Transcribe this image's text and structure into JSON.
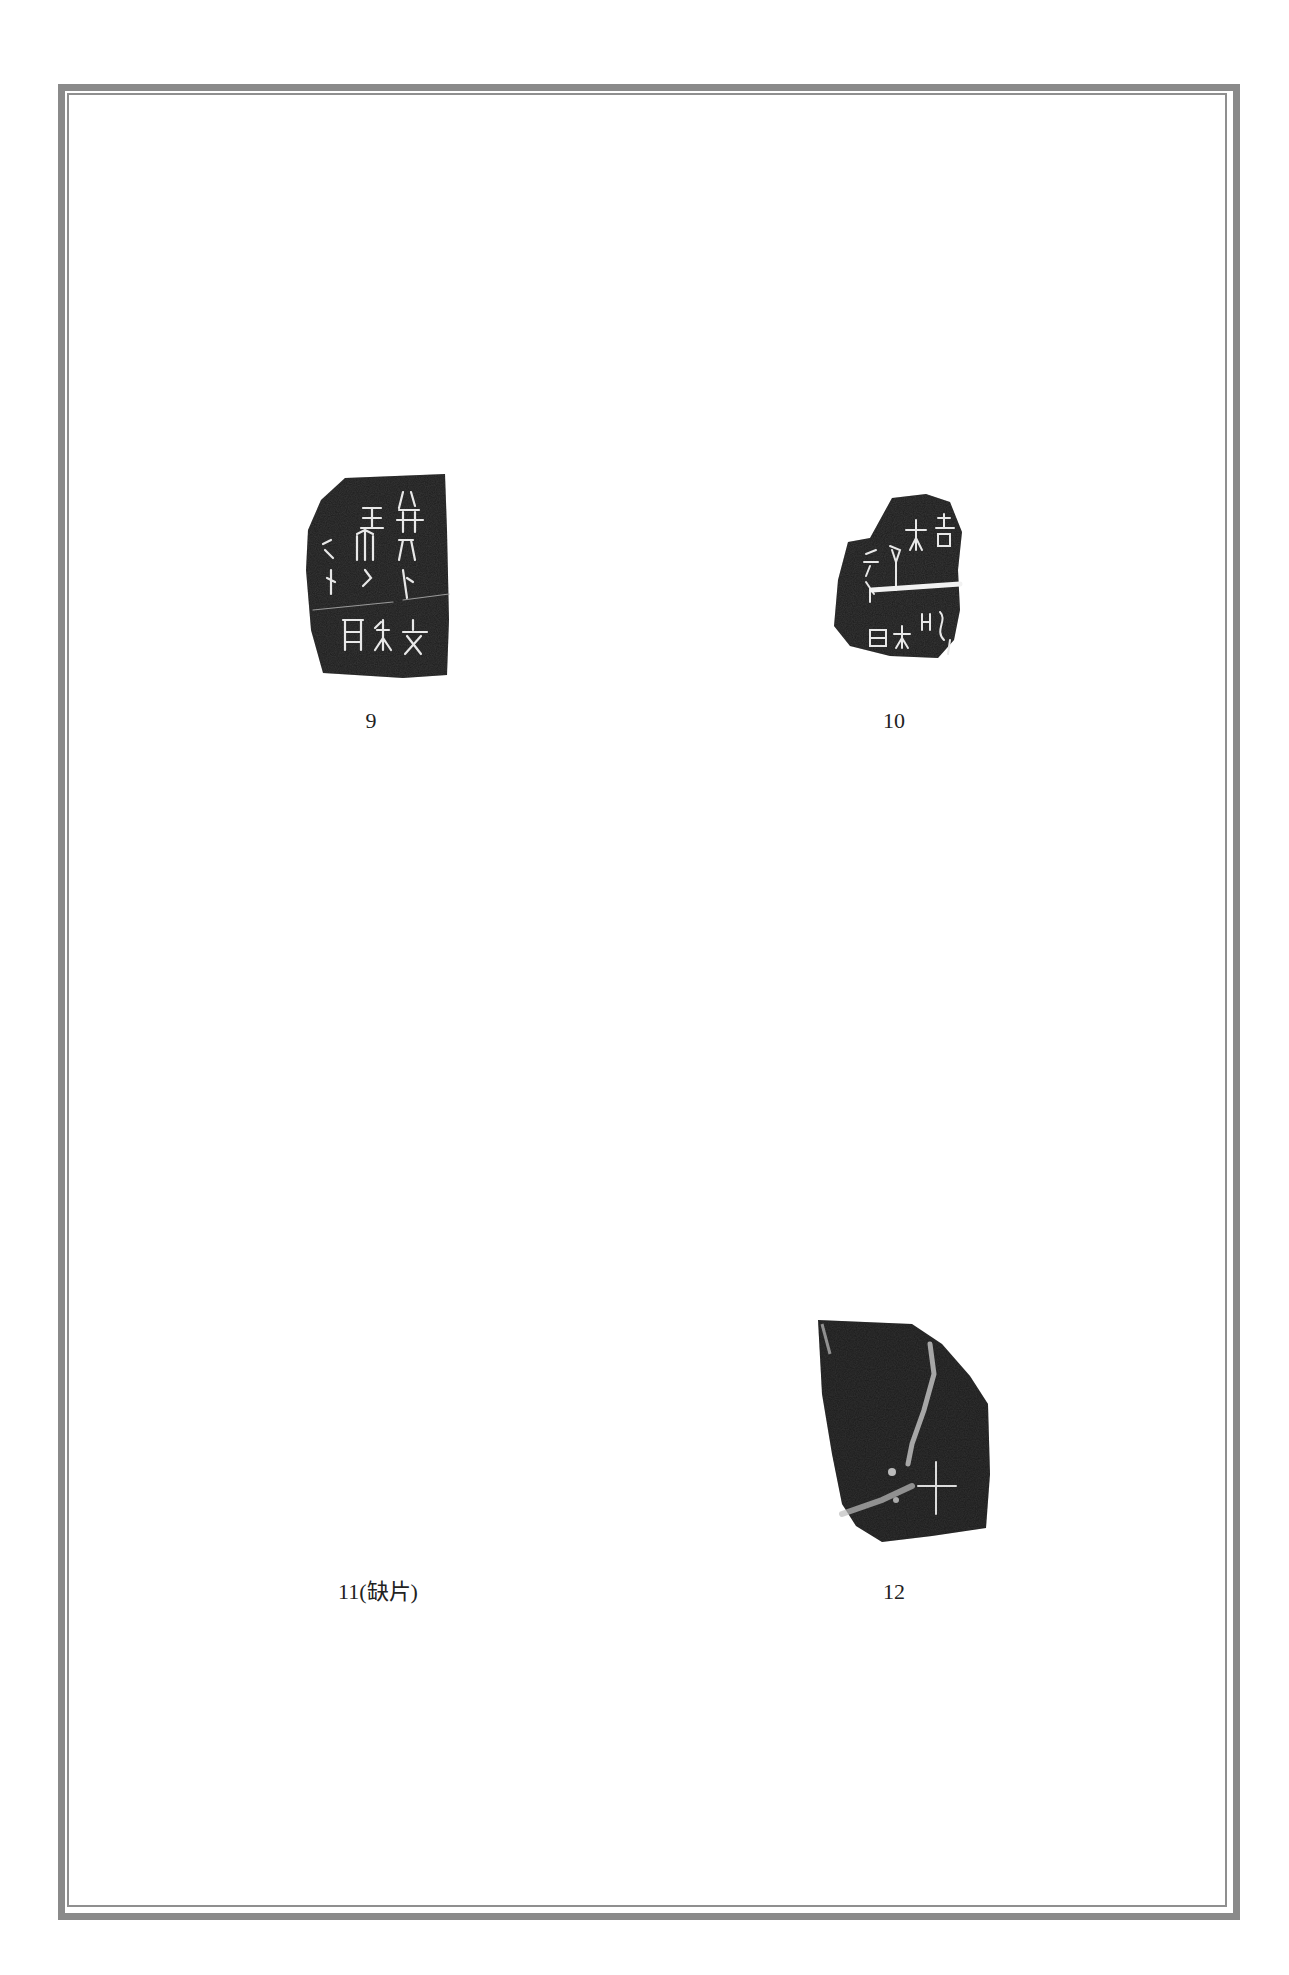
{
  "page": {
    "background": "#ffffff",
    "frame_color": "#8a8a8a"
  },
  "plates": [
    {
      "id": "9",
      "label": "9",
      "has_image": true,
      "glyphs": [
        "王",
        "㓝",
        "卜",
        "貞",
        "亡",
        "月",
        "文"
      ]
    },
    {
      "id": "10",
      "label": "10",
      "has_image": true,
      "glyphs": [
        "大",
        "壽",
        "余",
        "卜",
        "月",
        "亡",
        "吉"
      ]
    },
    {
      "id": "11",
      "label": "11(缺片)",
      "has_image": false
    },
    {
      "id": "12",
      "label": "12",
      "has_image": true,
      "glyphs": [
        "十"
      ]
    }
  ]
}
